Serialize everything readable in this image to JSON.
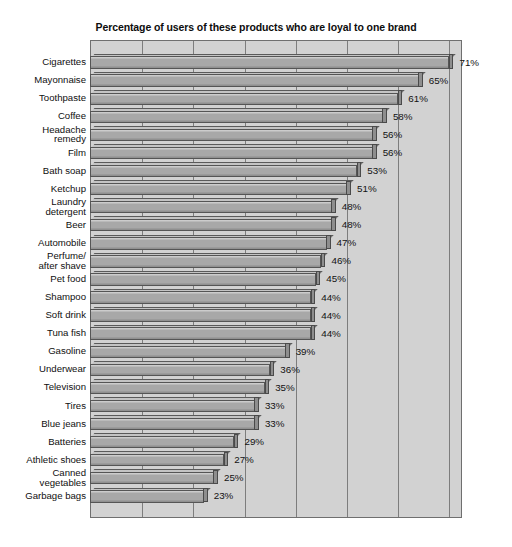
{
  "chart_data": {
    "type": "bar",
    "orientation": "horizontal",
    "title": "Percentage of users of these products who are loyal to one brand",
    "xlabel": "",
    "ylabel": "",
    "xlim": [
      0,
      71.5
    ],
    "grid": true,
    "gridline_interval": 10,
    "gridline_values": [
      10,
      20,
      30,
      40,
      50,
      60,
      70
    ],
    "legend": "none",
    "value_suffix": "%",
    "categories": [
      "Cigarettes",
      "Mayonnaise",
      "Toothpaste",
      "Coffee",
      "Headache\nremedy",
      "Film",
      "Bath soap",
      "Ketchup",
      "Laundry\ndetergent",
      "Beer",
      "Automobile",
      "Perfume/\nafter shave",
      "Pet food",
      "Shampoo",
      "Soft drink",
      "Tuna fish",
      "Gasoline",
      "Underwear",
      "Television",
      "Tires",
      "Blue jeans",
      "Batteries",
      "Athletic shoes",
      "Canned\nvegetables",
      "Garbage bags"
    ],
    "values": [
      71,
      65,
      61,
      58,
      56,
      56,
      53,
      51,
      48,
      48,
      47,
      46,
      45,
      44,
      44,
      44,
      39,
      36,
      35,
      33,
      33,
      29,
      27,
      25,
      23
    ],
    "value_labels": [
      "71%",
      "65%",
      "61%",
      "58%",
      "56%",
      "56%",
      "53%",
      "51%",
      "48%",
      "48%",
      "47%",
      "46%",
      "45%",
      "44%",
      "44%",
      "44%",
      "39%",
      "36%",
      "35%",
      "33%",
      "33%",
      "29%",
      "27%",
      "25%",
      "23%"
    ]
  },
  "style": {
    "plot_background": "#d2d2d2",
    "bar_fill": "#a8a8a8",
    "bar_edge": "#555555",
    "gridline_color": "#7d7d7d",
    "text_color": "#111111",
    "page_background": "#ffffff"
  }
}
